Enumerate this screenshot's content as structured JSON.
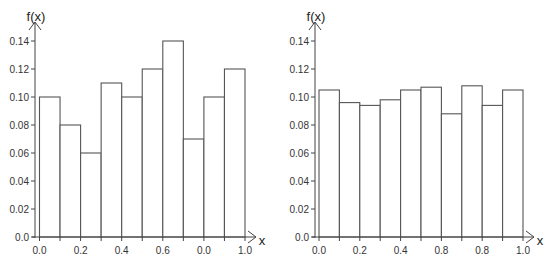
{
  "chart_data": [
    {
      "type": "bar",
      "title": "",
      "xlabel": "x",
      "ylabel": "f(x)",
      "bin_edges": [
        0.0,
        0.1,
        0.2,
        0.3,
        0.4,
        0.5,
        0.6,
        0.7,
        0.8,
        0.9,
        1.0
      ],
      "categories": [
        "0.0-0.1",
        "0.1-0.2",
        "0.2-0.3",
        "0.3-0.4",
        "0.4-0.5",
        "0.5-0.6",
        "0.6-0.7",
        "0.7-0.8",
        "0.8-0.9",
        "0.9-1.0"
      ],
      "values": [
        0.1,
        0.08,
        0.06,
        0.11,
        0.1,
        0.12,
        0.14,
        0.07,
        0.1,
        0.12
      ],
      "xlim": [
        0.0,
        1.0
      ],
      "ylim": [
        0.0,
        0.14
      ],
      "x_ticks": [
        "0.0",
        "0.2",
        "0.4",
        "0.6",
        "0.0",
        "1.0"
      ],
      "y_ticks": [
        "0.0",
        "0.02",
        "0.04",
        "0.06",
        "0.08",
        "0.10",
        "0.12",
        "0.14"
      ],
      "grid": false,
      "legend": null
    },
    {
      "type": "bar",
      "title": "",
      "xlabel": "x",
      "ylabel": "f(x)",
      "bin_edges": [
        0.0,
        0.1,
        0.2,
        0.3,
        0.4,
        0.5,
        0.6,
        0.7,
        0.8,
        0.9,
        1.0
      ],
      "categories": [
        "0.0-0.1",
        "0.1-0.2",
        "0.2-0.3",
        "0.3-0.4",
        "0.4-0.5",
        "0.5-0.6",
        "0.6-0.7",
        "0.7-0.8",
        "0.8-0.9",
        "0.9-1.0"
      ],
      "values": [
        0.105,
        0.096,
        0.094,
        0.098,
        0.105,
        0.107,
        0.088,
        0.108,
        0.094,
        0.105
      ],
      "xlim": [
        0.0,
        1.0
      ],
      "ylim": [
        0.0,
        0.14
      ],
      "x_ticks": [
        "0.0",
        "0.2",
        "0.4",
        "0.8",
        "0.8",
        "1.0"
      ],
      "y_ticks": [
        "0.0",
        "0.02",
        "0.04",
        "0.06",
        "0.08",
        "0.10",
        "0.12",
        "0.14"
      ],
      "grid": false,
      "legend": null
    }
  ],
  "layout": [
    {
      "x0": 39.5,
      "x1": 245,
      "y0": 237,
      "ymax_px": 41,
      "yaxis_x": 35,
      "arrow_x": 256,
      "xlabel_x": 262,
      "ylabel_x": 36,
      "ylabel_y": 21
    },
    {
      "x0": 319,
      "x1": 523,
      "y0": 237,
      "ymax_px": 41,
      "yaxis_x": 315,
      "arrow_x": 534,
      "xlabel_x": 540,
      "ylabel_x": 316,
      "ylabel_y": 21
    }
  ]
}
